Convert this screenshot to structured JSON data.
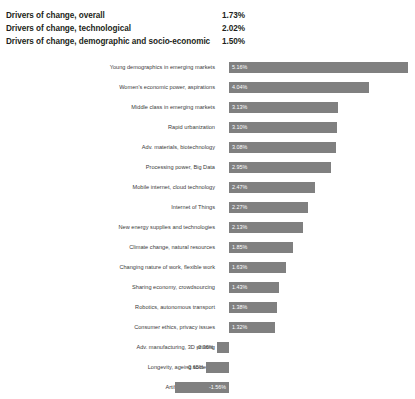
{
  "header": {
    "rows": [
      {
        "label": "Drivers of change, overall",
        "value": "1.73%"
      },
      {
        "label": "Drivers of change, technological",
        "value": "2.02%"
      },
      {
        "label": "Drivers of change, demographic and socio-economic",
        "value": "1.50%"
      }
    ]
  },
  "colors": {
    "bar": "#808080",
    "value_label_inside": "#ffffff",
    "value_label_outside": "#3a3a3a",
    "category_label": "#3a3a3a",
    "header_text": "#231f20",
    "background": "#ffffff"
  },
  "chart_data": {
    "type": "bar",
    "orientation": "horizontal",
    "title": "",
    "subtitle": "",
    "xlabel": "",
    "ylabel": "",
    "grid": false,
    "legend": "none",
    "axis_ticks": [],
    "xlim": [
      -2.0,
      5.5
    ],
    "zero_line": 0,
    "value_suffix": "%",
    "categories": [
      "Young demographics in emerging markets",
      "Women's economic power, aspirations",
      "Middle class in emerging markets",
      "Rapid urbanization",
      "Adv. materials, biotechnology",
      "Processing power, Big Data",
      "Mobile internet, cloud technology",
      "Internet of Things",
      "New energy supplies and technologies",
      "Climate change, natural resources",
      "Changing nature of work, flexible work",
      "Sharing economy, crowdsourcing",
      "Robotics, autonomous transport",
      "Consumer ethics, privacy issues",
      "Adv. manufacturing, 3D printing",
      "Longevity, ageing societies",
      "Artificial intelligence"
    ],
    "values": [
      5.16,
      4.04,
      3.13,
      3.1,
      3.08,
      2.95,
      2.47,
      2.27,
      2.13,
      1.85,
      1.63,
      1.43,
      1.38,
      1.32,
      -0.36,
      -0.65,
      -1.56
    ],
    "value_labels": [
      "5.16%",
      "4.04%",
      "3.13%",
      "3.10%",
      "3.08%",
      "2.95%",
      "2.47%",
      "2.27%",
      "2.13%",
      "1.85%",
      "1.63%",
      "1.43%",
      "1.38%",
      "1.32%",
      "-0.36%",
      "-0.65%",
      "-1.56%"
    ]
  }
}
